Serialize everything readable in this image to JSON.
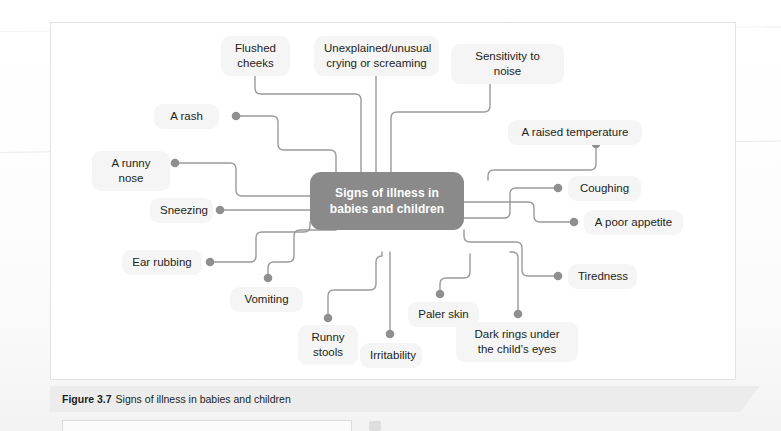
{
  "figure": {
    "caption_number": "Figure 3.7",
    "caption_text": "Signs of illness in babies and children"
  },
  "diagram": {
    "type": "mind-map",
    "center": {
      "label": "Signs of illness in\nbabies and children",
      "fill": "#8a8a8a",
      "text_color": "#ffffff"
    },
    "connector_color": "#9a9a9a",
    "node_fill": "#f5f5f5",
    "node_text_color": "#231f20",
    "nodes": [
      {
        "id": "flushed-cheeks",
        "label": "Flushed\ncheeks"
      },
      {
        "id": "unexplained-crying",
        "label": "Unexplained/unusual\ncrying or screaming"
      },
      {
        "id": "sensitivity-to-noise",
        "label": "Sensitivity to noise"
      },
      {
        "id": "a-rash",
        "label": "A rash"
      },
      {
        "id": "raised-temperature",
        "label": "A raised temperature"
      },
      {
        "id": "a-runny-nose",
        "label": "A runny nose"
      },
      {
        "id": "coughing",
        "label": "Coughing"
      },
      {
        "id": "sneezing",
        "label": "Sneezing"
      },
      {
        "id": "poor-appetite",
        "label": "A poor appetite"
      },
      {
        "id": "ear-rubbing",
        "label": "Ear rubbing"
      },
      {
        "id": "tiredness",
        "label": "Tiredness"
      },
      {
        "id": "vomiting",
        "label": "Vomiting"
      },
      {
        "id": "runny-stools",
        "label": "Runny\nstools"
      },
      {
        "id": "paler-skin",
        "label": "Paler skin"
      },
      {
        "id": "dark-rings",
        "label": "Dark rings under\nthe child’s eyes"
      },
      {
        "id": "irritability",
        "label": "Irritability"
      }
    ]
  }
}
